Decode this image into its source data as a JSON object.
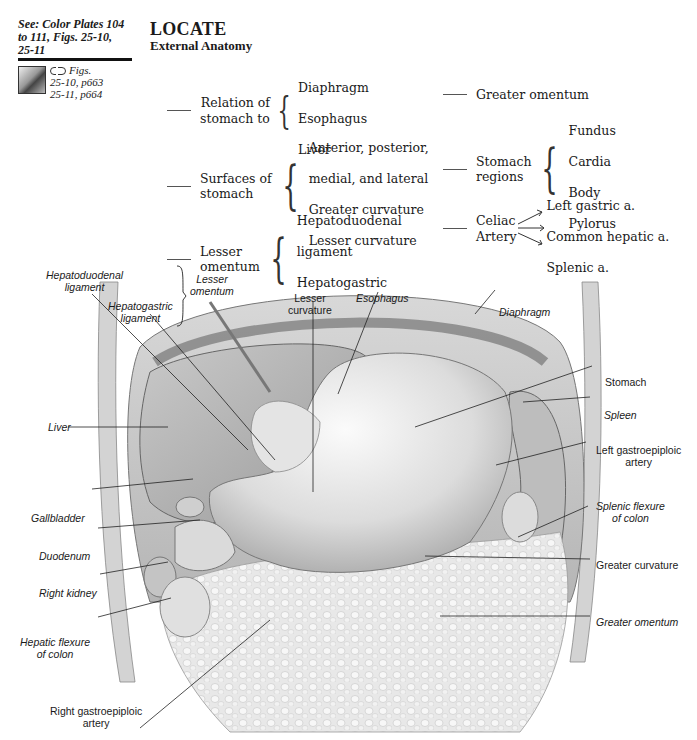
{
  "reference": {
    "see_text": "See: Color Plates 104 to 111, Figs. 25-10, 25-11",
    "thumbnail": "anatomy-thumbnail",
    "link_icon": "link-icon",
    "figs_label": "Figs.",
    "fig_refs": [
      "25-10, p663",
      "25-11, p664"
    ]
  },
  "header": {
    "title": "LOCATE",
    "subtitle": "External Anatomy"
  },
  "checklist_left": [
    {
      "label": "Relation of\nstomach to",
      "items": [
        "Diaphragm",
        "Esophagus",
        "Liver"
      ]
    },
    {
      "label": "Surfaces of\nstomach",
      "items": [
        "Anterior, posterior,",
        "medial, and lateral",
        "Greater curvature",
        "Lesser curvature"
      ]
    },
    {
      "label": "Lesser\nomentum",
      "items": [
        "Hepatoduodenal",
        "ligament",
        "Hepatogastric",
        "ligament"
      ]
    }
  ],
  "checklist_right": [
    {
      "label": "Greater omentum",
      "items": []
    },
    {
      "label": "Stomach\nregions",
      "items": [
        "Fundus",
        "Cardia",
        "Body",
        "Pylorus"
      ]
    },
    {
      "label": "Celiac\nArtery",
      "branches": [
        "Left gastric a.",
        "Common hepatic a.",
        "Splenic a."
      ]
    }
  ],
  "callouts": {
    "hepatoduodenal": "Hepatoduodenal\nligament",
    "hepatogastric": "Hepatogastric\nligament",
    "lesser_omentum": "Lesser\nomentum",
    "lesser_curvature": "Lesser\ncurvature",
    "esophagus": "Esophagus",
    "diaphragm": "Diaphragm",
    "stomach": "Stomach",
    "spleen": "Spleen",
    "left_gastroepiploic": "Left gastroepiploic\nartery",
    "splenic_flexure": "Splenic flexure\nof colon",
    "greater_curvature": "Greater curvature",
    "greater_omentum": "Greater omentum",
    "liver": "Liver",
    "gallbladder": "Gallbladder",
    "duodenum": "Duodenum",
    "right_kidney": "Right kidney",
    "hepatic_flexure": "Hepatic flexure\nof colon",
    "right_gastroepiploic": "Right gastroepiploic\nartery"
  }
}
